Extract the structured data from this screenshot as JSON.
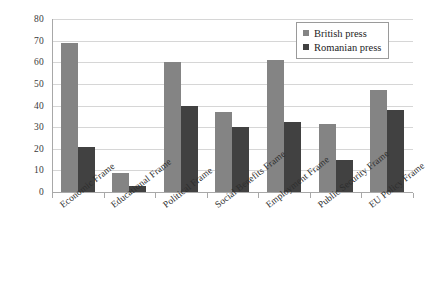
{
  "chart_data": {
    "type": "bar",
    "title": "",
    "subtitle": "",
    "xlabel": "",
    "ylabel": "",
    "ylim": [
      0,
      80
    ],
    "ytick_step": 10,
    "yticks": [
      80,
      70,
      60,
      50,
      40,
      30,
      20,
      10,
      0
    ],
    "grid": true,
    "grid_axis": "y",
    "legend_position": "top-right",
    "categories": [
      "Economic Frame",
      "Educational Frame",
      "Political Frame",
      "Social Benefits Frame",
      "Employment Frame",
      "Public Security Frame",
      "EU Policy Frame"
    ],
    "series": [
      {
        "name": "British press",
        "color": "#848484",
        "values": [
          69,
          9,
          60,
          37,
          61,
          31.5,
          47
        ]
      },
      {
        "name": "Romanian press",
        "color": "#414141",
        "values": [
          21,
          3,
          40,
          30,
          32.5,
          15,
          38
        ]
      }
    ]
  },
  "legend": {
    "items": [
      {
        "label": "British press",
        "color": "#848484"
      },
      {
        "label": "Romanian press",
        "color": "#414141"
      }
    ]
  },
  "colors": {
    "series_british": "#848484",
    "series_romanian": "#414141",
    "gridline": "#d6d6d6",
    "axis": "#a8a8a8",
    "text": "#2e2e2e",
    "background": "#ffffff"
  }
}
